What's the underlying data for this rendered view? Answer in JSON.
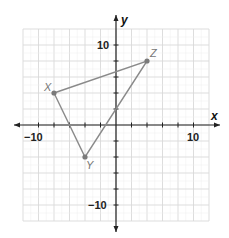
{
  "chart_data": {
    "type": "coordinate-plane-polygon",
    "title": "",
    "xlabel": "x",
    "ylabel": "y",
    "xlim": [
      -12,
      12
    ],
    "ylim": [
      -12,
      12
    ],
    "grid": true,
    "grid_minor_step": 1,
    "grid_major_step": 2,
    "tick_labels": {
      "x": [
        {
          "value": -10,
          "label": "−10"
        },
        {
          "value": 10,
          "label": "10"
        }
      ],
      "y": [
        {
          "value": 10,
          "label": "10"
        },
        {
          "value": -10,
          "label": "−10"
        }
      ]
    },
    "points": [
      {
        "name": "X",
        "x": -8,
        "y": 4
      },
      {
        "name": "Y",
        "x": -4,
        "y": -4
      },
      {
        "name": "Z",
        "x": 4,
        "y": 8
      }
    ],
    "polygon": [
      "X",
      "Y",
      "Z"
    ]
  },
  "labels": {
    "x_axis": "x",
    "y_axis": "y",
    "x_neg10": "−10",
    "x_pos10": "10",
    "y_pos10": "10",
    "y_neg10": "−10",
    "point_X": "X",
    "point_Y": "Y",
    "point_Z": "Z"
  },
  "colors": {
    "grid_major": "#d9d9d9",
    "grid_minor": "#eeeeee",
    "axis": "#222222",
    "triangle": "#8a8a8a",
    "point": "#7a7a7a",
    "point_label": "#777777"
  }
}
